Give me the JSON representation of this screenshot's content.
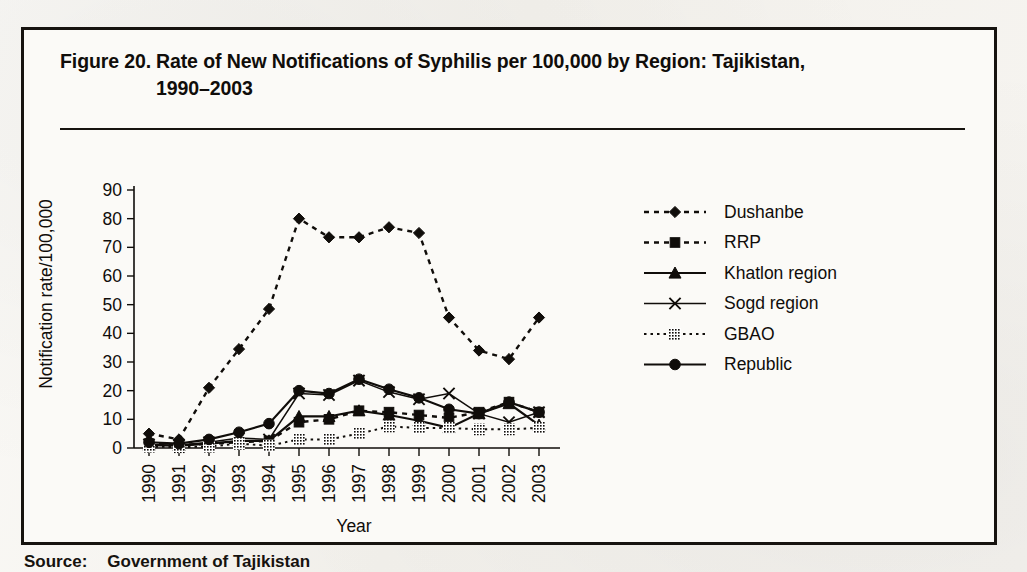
{
  "figure": {
    "number": "Figure 20.",
    "title_line1": "Rate of New Notifications of Syphilis per 100,000 by Region: Tajikistan,",
    "title_line2": "1990–2003"
  },
  "caption": {
    "source_label": "Source:",
    "source_text": "Government of Tajikistan"
  },
  "colors": {
    "ink": "#100d0a",
    "paper": "#fbfaf7",
    "page": "#f4f2ee"
  },
  "chart_data": {
    "type": "line",
    "title": "Rate of New Notifications of Syphilis per 100,000 by Region: Tajikistan, 1990–2003",
    "xlabel": "Year",
    "ylabel": "Notification rate/100,000",
    "x": [
      "1990",
      "1991",
      "1992",
      "1993",
      "1994",
      "1995",
      "1996",
      "1997",
      "1998",
      "1999",
      "2000",
      "2001",
      "2002",
      "2003"
    ],
    "ylim": [
      0,
      90
    ],
    "yticks": [
      0,
      10,
      20,
      30,
      40,
      50,
      60,
      70,
      80,
      90
    ],
    "grid": false,
    "legend_position": "right",
    "series": [
      {
        "name": "Dushanbe",
        "marker": "diamond",
        "linestyle": "dotted",
        "values": [
          5,
          3,
          21,
          34.5,
          48.5,
          80,
          73.5,
          73.5,
          77,
          75,
          45.5,
          34,
          31,
          45.5
        ]
      },
      {
        "name": "RRP",
        "marker": "square",
        "linestyle": "dotted",
        "values": [
          1.5,
          1,
          1.5,
          2,
          2.5,
          9,
          10,
          13,
          12.5,
          11.5,
          10.5,
          12.5,
          16,
          12.5
        ]
      },
      {
        "name": "Khatlon region",
        "marker": "triangle",
        "linestyle": "solid",
        "values": [
          1,
          0.8,
          1.5,
          2.5,
          2.5,
          11,
          11,
          13,
          11.5,
          9.5,
          7,
          12,
          15.5,
          8
        ]
      },
      {
        "name": "Sogd region",
        "marker": "cross",
        "linestyle": "solid-thin",
        "values": [
          1.2,
          1,
          2,
          3.5,
          3,
          19,
          18.5,
          23.5,
          19.5,
          17,
          19,
          12,
          9,
          12.5
        ]
      },
      {
        "name": "GBAO",
        "marker": "filled-box",
        "linestyle": "dotted-light",
        "values": [
          0.5,
          0.3,
          0.5,
          1.5,
          0.8,
          3,
          3,
          5,
          7.5,
          7,
          7,
          6.5,
          6.5,
          7
        ]
      },
      {
        "name": "Republic",
        "marker": "circle",
        "linestyle": "solid",
        "values": [
          2,
          1.5,
          3,
          5.5,
          8.5,
          20,
          19,
          24,
          20.5,
          17.5,
          13.5,
          12,
          16,
          12.5
        ]
      }
    ]
  }
}
